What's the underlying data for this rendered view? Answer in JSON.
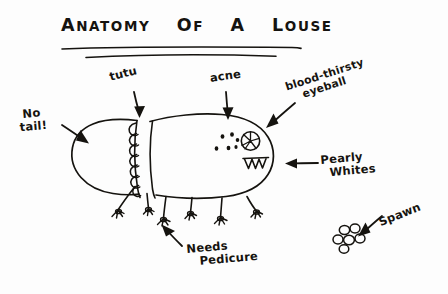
{
  "meta": {
    "background_color": "#fdfdfd",
    "ink_color": "#15130f"
  },
  "title": {
    "full_text": "ANATOMY OF A LOUSE",
    "words": [
      {
        "lead": "A",
        "rest": "NATOMY"
      },
      {
        "lead": "O",
        "rest": "F"
      },
      {
        "lead": "A",
        "rest": ""
      },
      {
        "lead": "L",
        "rest": "OUSE"
      }
    ],
    "underline_count": 2
  },
  "labels": {
    "tutu": {
      "text": "tutu",
      "points_to": "ruffled-segment-band",
      "arrow": "down"
    },
    "acne": {
      "text": "acne",
      "points_to": "body-dots",
      "arrow": "down"
    },
    "blood_thirsty_eyeball": {
      "line1": "blood-thirsty",
      "line2": "eyeball",
      "points_to": "eye",
      "arrow": "down-left"
    },
    "no_tail": {
      "line1": "No",
      "line2": "tail!",
      "points_to": "abdomen-rear",
      "arrow": "right-down"
    },
    "pearly_whites": {
      "line1": "Pearly",
      "line2": "Whites",
      "points_to": "teeth",
      "arrow": "left"
    },
    "needs_pedicure": {
      "line1": "Needs",
      "line2": "Pedicure",
      "points_to": "feet",
      "arrow": "up-left"
    },
    "spawn": {
      "text": "Spawn",
      "points_to": "egg-cluster",
      "arrow": "down-left"
    }
  },
  "figure": {
    "name": "louse",
    "parts": [
      "abdomen",
      "ruffled-tutu-band",
      "thorax-head",
      "eye",
      "teeth",
      "acne-dots",
      "legs",
      "feet"
    ],
    "leg_count": 6,
    "acne_dot_count": 6,
    "teeth_count": 4,
    "egg_count": 6
  }
}
